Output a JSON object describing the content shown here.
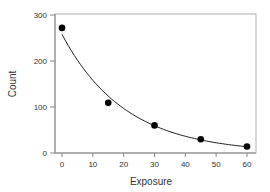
{
  "chart_data": {
    "type": "scatter",
    "title": "",
    "xlabel": "Exposure",
    "ylabel": "Count",
    "xlim": [
      0,
      60
    ],
    "ylim": [
      0,
      300
    ],
    "xticks": [
      0,
      10,
      20,
      30,
      40,
      50,
      60
    ],
    "yticks": [
      0,
      100,
      200,
      300
    ],
    "grid": false,
    "legend": null,
    "series": [
      {
        "name": "observed",
        "type": "scatter",
        "x": [
          0,
          15,
          30,
          45,
          60
        ],
        "y": [
          272,
          109,
          60,
          30,
          14
        ]
      },
      {
        "name": "exponential fit",
        "type": "line",
        "model": "y = 258 * exp(-0.049 * x)",
        "x": [
          0,
          5,
          10,
          15,
          20,
          25,
          30,
          35,
          40,
          45,
          50,
          55,
          60
        ],
        "y": [
          258,
          201,
          158,
          124,
          97,
          76,
          59,
          46,
          36,
          28,
          22,
          17,
          14
        ]
      }
    ]
  },
  "colors": {
    "points": "#000000",
    "line": "#222222",
    "axis": "#888888",
    "text": "#333333"
  }
}
